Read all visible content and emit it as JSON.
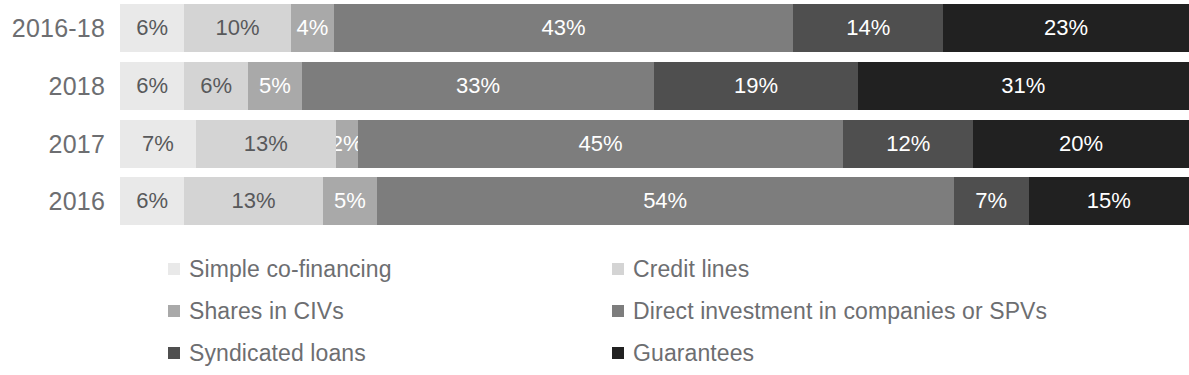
{
  "chart_data": {
    "type": "bar",
    "subtype": "stacked-horizontal-100",
    "title": "",
    "xlabel": "",
    "ylabel": "",
    "xlim": [
      0,
      100
    ],
    "grid": false,
    "legend_position": "bottom",
    "value_suffix": "%",
    "categories": [
      "2016-18",
      "2018",
      "2017",
      "2016"
    ],
    "series": [
      {
        "name": "Simple co-financing",
        "color": "#e8e8e8",
        "label_color": "#58595b",
        "values": [
          6,
          6,
          7,
          6
        ]
      },
      {
        "name": "Credit lines",
        "color": "#d0d0d0",
        "label_color": "#58595b",
        "values": [
          10,
          6,
          13,
          13
        ]
      },
      {
        "name": "Shares in CIVs",
        "color": "#a6a6a6",
        "label_color": "#ffffff",
        "values": [
          4,
          5,
          2,
          5
        ]
      },
      {
        "name": "Direct investment in companies or SPVs",
        "color": "#7a7a7a",
        "label_color": "#ffffff",
        "values": [
          43,
          33,
          45,
          54
        ]
      },
      {
        "name": "Syndicated loans",
        "color": "#4d4d4d",
        "label_color": "#ffffff",
        "values": [
          14,
          19,
          12,
          7
        ]
      },
      {
        "name": "Guarantees",
        "color": "#1f1f1f",
        "label_color": "#ffffff",
        "values": [
          23,
          31,
          20,
          15
        ]
      }
    ],
    "rows": [
      {
        "label": "2016-18",
        "segments": [
          {
            "name": "Simple co-financing",
            "value": 6,
            "text": "6%",
            "color": "#e9e9e9",
            "label_color": "#58595b"
          },
          {
            "name": "Credit lines",
            "value": 10,
            "text": "10%",
            "color": "#d4d4d4",
            "label_color": "#58595b"
          },
          {
            "name": "Shares in CIVs",
            "value": 4,
            "text": "4%",
            "color": "#a9a9a9",
            "label_color": "#ffffff"
          },
          {
            "name": "Direct investment in companies or SPVs",
            "value": 43,
            "text": "43%",
            "color": "#7d7d7d",
            "label_color": "#ffffff"
          },
          {
            "name": "Syndicated loans",
            "value": 14,
            "text": "14%",
            "color": "#4f4f4f",
            "label_color": "#ffffff"
          },
          {
            "name": "Guarantees",
            "value": 23,
            "text": "23%",
            "color": "#212121",
            "label_color": "#ffffff"
          }
        ]
      },
      {
        "label": "2018",
        "segments": [
          {
            "name": "Simple co-financing",
            "value": 6,
            "text": "6%",
            "color": "#e9e9e9",
            "label_color": "#58595b"
          },
          {
            "name": "Credit lines",
            "value": 6,
            "text": "6%",
            "color": "#d4d4d4",
            "label_color": "#58595b"
          },
          {
            "name": "Shares in CIVs",
            "value": 5,
            "text": "5%",
            "color": "#a9a9a9",
            "label_color": "#ffffff"
          },
          {
            "name": "Direct investment in companies or SPVs",
            "value": 33,
            "text": "33%",
            "color": "#7d7d7d",
            "label_color": "#ffffff"
          },
          {
            "name": "Syndicated loans",
            "value": 19,
            "text": "19%",
            "color": "#4f4f4f",
            "label_color": "#ffffff"
          },
          {
            "name": "Guarantees",
            "value": 31,
            "text": "31%",
            "color": "#212121",
            "label_color": "#ffffff"
          }
        ]
      },
      {
        "label": "2017",
        "segments": [
          {
            "name": "Simple co-financing",
            "value": 7,
            "text": "7%",
            "color": "#e9e9e9",
            "label_color": "#58595b"
          },
          {
            "name": "Credit lines",
            "value": 13,
            "text": "13%",
            "color": "#d4d4d4",
            "label_color": "#58595b"
          },
          {
            "name": "Shares in CIVs",
            "value": 2,
            "text": "2%",
            "color": "#a9a9a9",
            "label_color": "#ffffff"
          },
          {
            "name": "Direct investment in companies or SPVs",
            "value": 45,
            "text": "45%",
            "color": "#7d7d7d",
            "label_color": "#ffffff"
          },
          {
            "name": "Syndicated loans",
            "value": 12,
            "text": "12%",
            "color": "#4f4f4f",
            "label_color": "#ffffff"
          },
          {
            "name": "Guarantees",
            "value": 20,
            "text": "20%",
            "color": "#212121",
            "label_color": "#ffffff"
          }
        ]
      },
      {
        "label": "2016",
        "segments": [
          {
            "name": "Simple co-financing",
            "value": 6,
            "text": "6%",
            "color": "#e9e9e9",
            "label_color": "#58595b"
          },
          {
            "name": "Credit lines",
            "value": 13,
            "text": "13%",
            "color": "#d4d4d4",
            "label_color": "#58595b"
          },
          {
            "name": "Shares in CIVs",
            "value": 5,
            "text": "5%",
            "color": "#a9a9a9",
            "label_color": "#ffffff"
          },
          {
            "name": "Direct investment in companies or SPVs",
            "value": 54,
            "text": "54%",
            "color": "#7d7d7d",
            "label_color": "#ffffff"
          },
          {
            "name": "Syndicated loans",
            "value": 7,
            "text": "7%",
            "color": "#4f4f4f",
            "label_color": "#ffffff"
          },
          {
            "name": "Guarantees",
            "value": 15,
            "text": "15%",
            "color": "#212121",
            "label_color": "#ffffff"
          }
        ]
      }
    ],
    "legend": {
      "left_column": [
        {
          "label": "Simple co-financing",
          "color": "#e9e9e9"
        },
        {
          "label": "Shares in CIVs",
          "color": "#a9a9a9"
        },
        {
          "label": "Syndicated loans",
          "color": "#4f4f4f"
        }
      ],
      "right_column": [
        {
          "label": "Credit lines",
          "color": "#d4d4d4"
        },
        {
          "label": "Direct investment in companies or SPVs",
          "color": "#7d7d7d"
        },
        {
          "label": "Guarantees",
          "color": "#212121"
        }
      ]
    }
  }
}
